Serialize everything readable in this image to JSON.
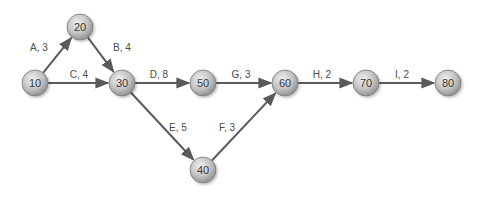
{
  "diagram": {
    "type": "activity-on-arrow network",
    "colors": {
      "edge": "#5a5a5a",
      "node_light": "#dedede",
      "node_dark": "#8c8c8c",
      "node_stroke": "#7a7a7a",
      "text": "#3a3a3a"
    },
    "nodes": [
      {
        "id": "10",
        "label": "10",
        "x": 35,
        "y": 83
      },
      {
        "id": "20",
        "label": "20",
        "x": 80,
        "y": 27
      },
      {
        "id": "30",
        "label": "30",
        "x": 122,
        "y": 83
      },
      {
        "id": "40",
        "label": "40",
        "x": 203,
        "y": 170
      },
      {
        "id": "50",
        "label": "50",
        "x": 203,
        "y": 83
      },
      {
        "id": "60",
        "label": "60",
        "x": 285,
        "y": 83
      },
      {
        "id": "70",
        "label": "70",
        "x": 366,
        "y": 83
      },
      {
        "id": "80",
        "label": "80",
        "x": 448,
        "y": 83
      }
    ],
    "edges": [
      {
        "from": "10",
        "to": "20",
        "activity": "A",
        "duration": 3,
        "label": "A, 3",
        "lx": 39,
        "ly": 51
      },
      {
        "from": "20",
        "to": "30",
        "activity": "B",
        "duration": 4,
        "label": "B, 4",
        "lx": 122,
        "ly": 51
      },
      {
        "from": "10",
        "to": "30",
        "activity": "C",
        "duration": 4,
        "label": "C, 4",
        "lx": 79,
        "ly": 78
      },
      {
        "from": "30",
        "to": "50",
        "activity": "D",
        "duration": 8,
        "label": "D, 8",
        "lx": 159,
        "ly": 78
      },
      {
        "from": "30",
        "to": "40",
        "activity": "E",
        "duration": 5,
        "label": "E, 5",
        "lx": 178,
        "ly": 131
      },
      {
        "from": "40",
        "to": "60",
        "activity": "F",
        "duration": 3,
        "label": "F, 3",
        "lx": 227,
        "ly": 131
      },
      {
        "from": "50",
        "to": "60",
        "activity": "G",
        "duration": 3,
        "label": "G, 3",
        "lx": 241,
        "ly": 78
      },
      {
        "from": "60",
        "to": "70",
        "activity": "H",
        "duration": 2,
        "label": "H, 2",
        "lx": 322,
        "ly": 78
      },
      {
        "from": "70",
        "to": "80",
        "activity": "I",
        "duration": 2,
        "label": "I, 2",
        "lx": 402,
        "ly": 78
      }
    ]
  }
}
